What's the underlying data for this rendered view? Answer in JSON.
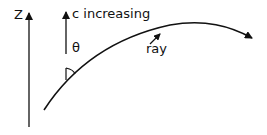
{
  "diagram": {
    "axis_label": "Z",
    "velocity_label": "c increasing",
    "angle_label": "θ",
    "ray_label": "ray",
    "ink_color": "#111111",
    "background": "#ffffff"
  }
}
